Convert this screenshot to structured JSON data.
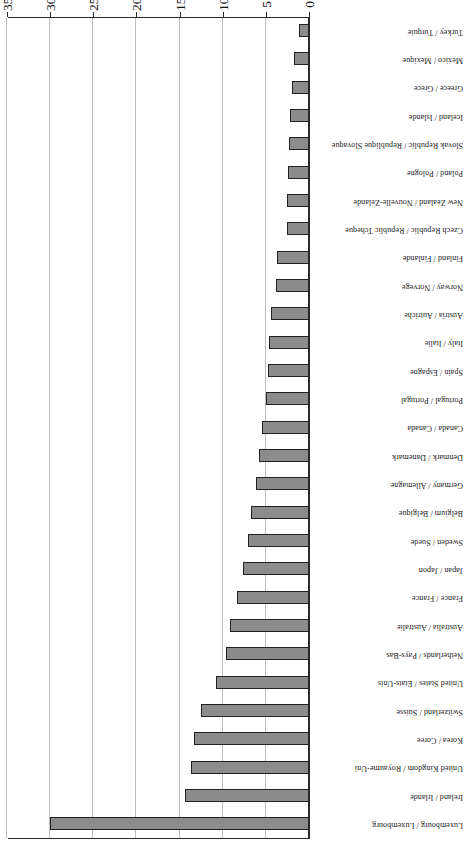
{
  "chart_data": {
    "type": "bar",
    "orientation": "horizontal",
    "title": "",
    "subtitle": "",
    "xlabel": "",
    "ylabel": "",
    "xlim": [
      0,
      35
    ],
    "xticks": [
      0,
      5,
      10,
      15,
      20,
      25,
      30,
      35
    ],
    "xtick_labels": [
      "0",
      "5",
      "10",
      "15",
      "20",
      "25",
      "30",
      "35"
    ],
    "grid": true,
    "legend": false,
    "rotation_deg": 180,
    "bar_color": "#8c8c8c",
    "bar_edge_color": "#222222",
    "axis_color": "#2b2b2b",
    "gridline_color": "#bdbdbd",
    "categories": [
      "Luxembourg / Luxembourg",
      "Ireland / Irlande",
      "United Kingdom / Royaume-Uni",
      "Korea / Coree",
      "Switzerland / Suisse",
      "United States / Etats-Unis",
      "Netherlands / Pays-Bas",
      "Australia / Australie",
      "France / France",
      "Japan / Japon",
      "Sweden / Suede",
      "Belgium / Belgique",
      "Germany / Allemagne",
      "Denmark / Danemark",
      "Canada / Canada",
      "Portugal / Portugal",
      "Spain / Espagne",
      "Italy / Italie",
      "Austria / Autriche",
      "Norway / Norvege",
      "Finland / Finlande",
      "Czech Republic / Republic Tcheque",
      "New Zealand / Nouvelle-Zelande",
      "Poland / Pologne",
      "Slovak Republic / Republique Slovaque",
      "Iceland / Islande",
      "Greece / Grece",
      "Mexico / Mexique",
      "Turkey / Turquie"
    ],
    "values": [
      30.0,
      14.4,
      13.7,
      13.3,
      12.5,
      10.8,
      9.6,
      9.2,
      8.3,
      7.6,
      7.1,
      6.7,
      6.2,
      5.8,
      5.4,
      5.0,
      4.8,
      4.6,
      4.4,
      3.8,
      3.7,
      2.6,
      2.5,
      2.4,
      2.3,
      2.2,
      2.0,
      1.7,
      1.2
    ]
  }
}
